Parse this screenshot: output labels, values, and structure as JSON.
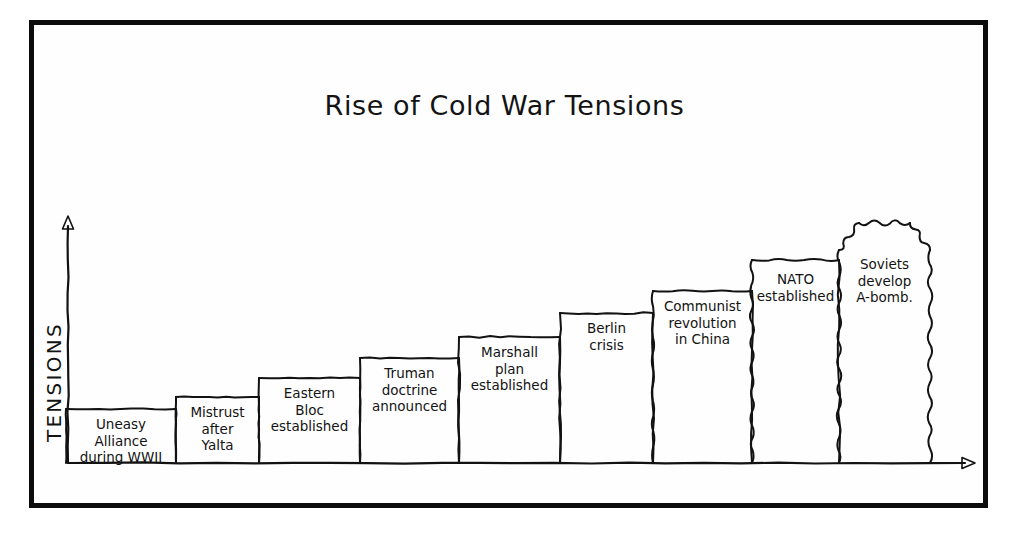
{
  "figure": {
    "title": "Rise of Cold War Tensions",
    "y_axis_label": "TENSIONS",
    "ink_color": "#121212",
    "background_color": "#ffffff",
    "frame_color": "#0c0c0c"
  },
  "chart_data": {
    "type": "bar",
    "title": "Rise of Cold War Tensions",
    "xlabel": "",
    "ylabel": "TENSIONS",
    "grid": false,
    "legend": false,
    "axis_arrows": {
      "x": "right",
      "y": "up"
    },
    "x_tick_labels": [],
    "y_tick_labels": [],
    "ylim": [
      0,
      10
    ],
    "categories": [
      "Uneasy Alliance during WWII",
      "Mistrust after Yalta",
      "Eastern Bloc established",
      "Truman doctrine announced",
      "Marshall plan established",
      "Berlin crisis",
      "Communist revolution in China",
      "NATO established",
      "Soviets develop A-bomb."
    ],
    "values": [
      1.1,
      1.6,
      2.4,
      3.2,
      4.1,
      5.1,
      6.0,
      7.2,
      8.8
    ],
    "bars": [
      {
        "index": 0,
        "label_lines": [
          "Uneasy Alliance",
          "during WWII"
        ],
        "value": 1.1,
        "x_left": 66,
        "x_right": 176,
        "top": 409,
        "waviness": "straight"
      },
      {
        "index": 1,
        "label_lines": [
          "Mistrust",
          "after",
          "Yalta"
        ],
        "value": 1.6,
        "x_left": 176,
        "x_right": 259,
        "top": 397,
        "waviness": "straight"
      },
      {
        "index": 2,
        "label_lines": [
          "Eastern",
          "Bloc",
          "established"
        ],
        "value": 2.4,
        "x_left": 259,
        "x_right": 360,
        "top": 378,
        "waviness": "straight"
      },
      {
        "index": 3,
        "label_lines": [
          "Truman",
          "doctrine",
          "announced"
        ],
        "value": 3.2,
        "x_left": 360,
        "x_right": 459,
        "top": 358,
        "waviness": "straight"
      },
      {
        "index": 4,
        "label_lines": [
          "Marshall",
          "plan",
          "established"
        ],
        "value": 4.1,
        "x_left": 459,
        "x_right": 560,
        "top": 337,
        "waviness": "slight"
      },
      {
        "index": 5,
        "label_lines": [
          "Berlin",
          "crisis"
        ],
        "value": 5.1,
        "x_left": 560,
        "x_right": 653,
        "top": 313,
        "waviness": "slight"
      },
      {
        "index": 6,
        "label_lines": [
          "Communist",
          "revolution",
          "in China"
        ],
        "value": 6.0,
        "x_left": 653,
        "x_right": 752,
        "top": 291,
        "waviness": "wavy"
      },
      {
        "index": 7,
        "label_lines": [
          "NATO",
          "established"
        ],
        "value": 7.2,
        "x_left": 752,
        "x_right": 839,
        "top": 260,
        "waviness": "very-wavy"
      },
      {
        "index": 8,
        "label_lines": [
          "Soviets",
          "develop",
          "A-bomb."
        ],
        "value": 8.8,
        "x_left": 839,
        "x_right": 930,
        "top": 220,
        "waviness": "jagged"
      }
    ],
    "baseline_y": 463,
    "y_axis_x": 68,
    "y_axis_top": 216,
    "x_axis_right": 975,
    "annotations": []
  }
}
